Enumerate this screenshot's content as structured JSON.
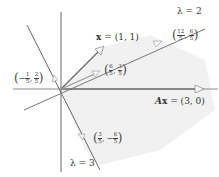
{
  "diagram": {
    "type": "eigenvector-geometry",
    "origin_px": [
      61,
      89
    ],
    "vectors": {
      "x": {
        "label_bold": "x",
        "label_rest": " = (1, 1)",
        "value": [
          1,
          1
        ]
      },
      "Ax": {
        "label_italic": "A",
        "label_bold": "x",
        "label_rest": " = (3, 0)",
        "value": [
          3,
          0
        ]
      }
    },
    "eigenlines": [
      {
        "label": "λ = 2",
        "direction": "upper-right"
      },
      {
        "label": "λ = 3",
        "direction": "lower-right"
      }
    ],
    "points": [
      {
        "name": "proj-lambda2",
        "sign": "",
        "x_num": "6",
        "x_den": "5",
        "y_sign": "",
        "y_num": "3",
        "y_den": "5"
      },
      {
        "name": "image-lambda2",
        "sign": "",
        "x_num": "12",
        "x_den": "5",
        "y_sign": "",
        "y_num": "6",
        "y_den": "5"
      },
      {
        "name": "proj-lambda3",
        "sign": "−",
        "x_num": "1",
        "x_den": "5",
        "y_sign": "",
        "y_num": "2",
        "y_den": "5"
      },
      {
        "name": "image-lambda3",
        "sign": "",
        "x_num": "3",
        "x_den": "5",
        "y_sign": "−",
        "y_num": "6",
        "y_den": "5"
      }
    ],
    "colors": {
      "axis": "#555555",
      "vector": "#666666",
      "eigenline": "#555555",
      "shade": "#eeeeee",
      "arrowhead_fill": "#f2f2f2"
    }
  }
}
